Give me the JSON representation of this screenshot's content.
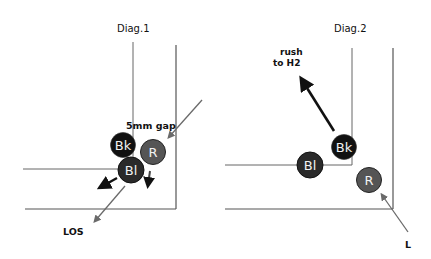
{
  "diagrams": [
    {
      "title": "Diag.1",
      "annotations": {
        "gap": "5mm gap",
        "los": "LOS"
      },
      "balls": [
        {
          "label": "Bk",
          "color": "#111111"
        },
        {
          "label": "R",
          "color": "#555555"
        },
        {
          "label": "Bl",
          "color": "#2a2a2a"
        }
      ]
    },
    {
      "title": "Diag.2",
      "annotations": {
        "rush_line1": "rush",
        "rush_line2": "to H2",
        "los_partial": "L"
      },
      "balls": [
        {
          "label": "Bk",
          "color": "#111111"
        },
        {
          "label": "Bl",
          "color": "#2a2a2a"
        },
        {
          "label": "R",
          "color": "#555555"
        }
      ]
    }
  ],
  "colors": {
    "line": "#666666",
    "arrow_dark": "#111111",
    "arrow_gray": "#6a6a6a"
  }
}
